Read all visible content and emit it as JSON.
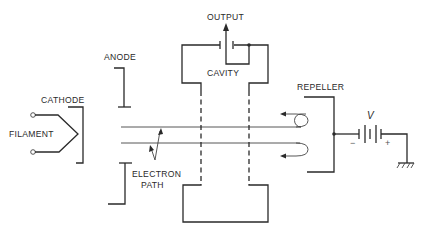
{
  "diagram": {
    "labels": {
      "output": "OUTPUT",
      "anode": "ANODE",
      "cavity": "CAVITY",
      "repeller": "REPELLER",
      "cathode": "CATHODE",
      "filament": "FILAMENT",
      "electron_path_line1": "ELECTRON",
      "electron_path_line2": "PATH",
      "voltage": "V",
      "minus": "−",
      "plus": "+"
    },
    "components": [
      "filament",
      "cathode",
      "anode",
      "cavity",
      "output",
      "electron-beam",
      "repeller",
      "battery",
      "ground"
    ],
    "colors": {
      "ink": "#2a2a2a",
      "background": "#ffffff"
    }
  }
}
